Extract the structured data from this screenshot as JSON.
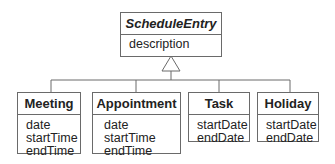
{
  "diagram": {
    "type": "UML class diagram (generalization)",
    "superclass": {
      "name": "ScheduleEntry",
      "italic": true,
      "attributes": [
        "description"
      ]
    },
    "subclasses": [
      {
        "name": "Meeting",
        "attributes": [
          "date",
          "startTime",
          "endTime"
        ]
      },
      {
        "name": "Appointment",
        "attributes": [
          "date",
          "startTime",
          "endTime"
        ]
      },
      {
        "name": "Task",
        "attributes": [
          "startDate",
          "endDate"
        ]
      },
      {
        "name": "Holiday",
        "attributes": [
          "startDate",
          "endDate"
        ]
      }
    ],
    "line_color": "#6a6a6a"
  }
}
